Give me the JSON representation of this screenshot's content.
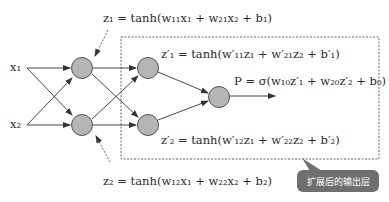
{
  "inputs": [
    {
      "label": "x₁"
    },
    {
      "label": "x₂"
    }
  ],
  "equations": {
    "z1": "z₁ = tanh(w₁₁x₁ + w₂₁x₂ + b₁)",
    "z2": "z₂ = tanh(w₁₂x₁ + w₂₂x₂ + b₂)",
    "z1p": "z′₁ = tanh(w′₁₁z₁ + w′₂₁z₂ + b′₁)",
    "z2p": "z′₂ = tanh(w′₁₂z₁ + w′₂₂z₂ + b′₂)",
    "P": "P = σ(w₁₀z′₁ + w₂₀z′₂ + b₀)"
  },
  "callout": {
    "label": "扩展后的输出层"
  },
  "colors": {
    "node_fill": "#b5b5b5",
    "node_stroke": "#444444",
    "callout_bg": "#6f6f6f"
  }
}
